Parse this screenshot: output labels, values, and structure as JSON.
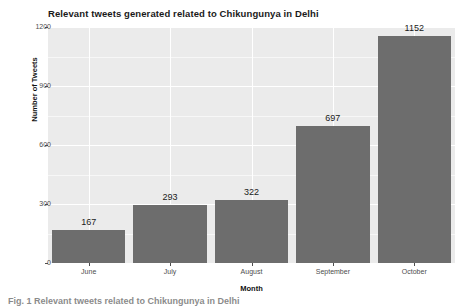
{
  "chart_data": {
    "type": "bar",
    "title": "Relevant tweets generated related to Chikungunya in Delhi",
    "xlabel": "Month",
    "ylabel": "Number of Tweets",
    "categories": [
      "June",
      "July",
      "August",
      "September",
      "October"
    ],
    "values": [
      167,
      293,
      322,
      697,
      1152
    ],
    "value_labels": [
      "167",
      "293",
      "322",
      "697",
      "1152"
    ],
    "ylim": [
      0,
      1200
    ],
    "ytick_labels": [
      "0",
      "300",
      "600",
      "900",
      "1200"
    ],
    "ytick_values": [
      0,
      300,
      600,
      900,
      1200
    ],
    "grid": true,
    "legend": "none",
    "series_name": "Number of Tweets",
    "colors": {
      "bar_fill": "#6d6d6d",
      "panel_background": "#ebebeb",
      "gridline": "#ffffff",
      "figure_background": "#ffffff",
      "text": "#1a1a1a",
      "tick_text": "#4d4d4d"
    }
  },
  "caption": {
    "text": "Fig. 1 Relevant tweets related to Chikungunya in Delhi"
  }
}
